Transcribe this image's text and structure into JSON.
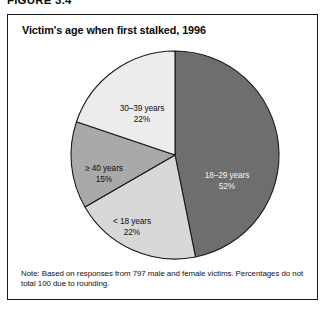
{
  "figure": {
    "number_label": "FIGURE 3.4",
    "title": "Victim's age when first stalked, 1996",
    "note": "Note: Based on responses from 797 male and female victims. Percentages do not total 100 due to rounding."
  },
  "chart_data": {
    "type": "pie",
    "title": "Victim's age when first stalked, 1996",
    "xlabel": "",
    "ylabel": "",
    "unit": "percent",
    "total_respondents": 797,
    "start_angle_deg": 0,
    "direction": "clockwise",
    "legend": "none-inline-labels",
    "categories": [
      "18–29 years",
      "< 18 years",
      "≥ 40 years",
      "30–39 years"
    ],
    "values": [
      52,
      22,
      15,
      22
    ],
    "slices": [
      {
        "label": "18–29 years",
        "percent_text": "52%",
        "value": 52,
        "color": "#6e6e6e",
        "label_color": "#f2f2f2",
        "label_x": 219,
        "label_y": 129
      },
      {
        "label": "< 18 years",
        "percent_text": "22%",
        "value": 22,
        "color": "#d8d8d8",
        "label_color": "#111111",
        "label_x": 124,
        "label_y": 175
      },
      {
        "label": "≥ 40 years",
        "percent_text": "15%",
        "value": 15,
        "color": "#a9a9a9",
        "label_color": "#111111",
        "label_x": 96,
        "label_y": 122
      },
      {
        "label": "30–39 years",
        "percent_text": "22%",
        "value": 22,
        "color": "#ececec",
        "label_color": "#111111",
        "label_x": 134,
        "label_y": 62
      }
    ],
    "stroke_color": "#1a1a1a",
    "center": [
      167,
      106
    ],
    "radius": 104
  }
}
